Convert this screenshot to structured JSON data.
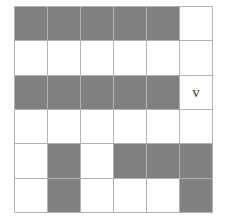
{
  "puzzle": {
    "title": "Shaded Grid Pattern",
    "rows": 6,
    "columns": 6,
    "fill_color": "#808080",
    "empty_color": "#ffffff",
    "gridline_color": "#b2b2b2",
    "label_color": "#3a3a3a",
    "cells": [
      [
        {
          "id": "r1c1",
          "state": "filled",
          "label": ""
        },
        {
          "id": "r1c2",
          "state": "filled",
          "label": ""
        },
        {
          "id": "r1c3",
          "state": "filled",
          "label": ""
        },
        {
          "id": "r1c4",
          "state": "filled",
          "label": ""
        },
        {
          "id": "r1c5",
          "state": "filled",
          "label": ""
        },
        {
          "id": "r1c6",
          "state": "empty",
          "label": ""
        }
      ],
      [
        {
          "id": "r2c1",
          "state": "empty",
          "label": ""
        },
        {
          "id": "r2c2",
          "state": "empty",
          "label": ""
        },
        {
          "id": "r2c3",
          "state": "empty",
          "label": ""
        },
        {
          "id": "r2c4",
          "state": "empty",
          "label": ""
        },
        {
          "id": "r2c5",
          "state": "empty",
          "label": ""
        },
        {
          "id": "r2c6",
          "state": "empty",
          "label": ""
        }
      ],
      [
        {
          "id": "r3c1",
          "state": "filled",
          "label": ""
        },
        {
          "id": "r3c2",
          "state": "filled",
          "label": ""
        },
        {
          "id": "r3c3",
          "state": "filled",
          "label": ""
        },
        {
          "id": "r3c4",
          "state": "filled",
          "label": ""
        },
        {
          "id": "r3c5",
          "state": "filled",
          "label": ""
        },
        {
          "id": "r3c6",
          "state": "empty",
          "label": "v"
        }
      ],
      [
        {
          "id": "r4c1",
          "state": "empty",
          "label": ""
        },
        {
          "id": "r4c2",
          "state": "empty",
          "label": ""
        },
        {
          "id": "r4c3",
          "state": "empty",
          "label": ""
        },
        {
          "id": "r4c4",
          "state": "empty",
          "label": ""
        },
        {
          "id": "r4c5",
          "state": "empty",
          "label": ""
        },
        {
          "id": "r4c6",
          "state": "empty",
          "label": ""
        }
      ],
      [
        {
          "id": "r5c1",
          "state": "empty",
          "label": ""
        },
        {
          "id": "r5c2",
          "state": "filled",
          "label": ""
        },
        {
          "id": "r5c3",
          "state": "empty",
          "label": ""
        },
        {
          "id": "r5c4",
          "state": "filled",
          "label": ""
        },
        {
          "id": "r5c5",
          "state": "filled",
          "label": ""
        },
        {
          "id": "r5c6",
          "state": "filled",
          "label": ""
        }
      ],
      [
        {
          "id": "r6c1",
          "state": "empty",
          "label": ""
        },
        {
          "id": "r6c2",
          "state": "filled",
          "label": ""
        },
        {
          "id": "r6c3",
          "state": "empty",
          "label": ""
        },
        {
          "id": "r6c4",
          "state": "empty",
          "label": ""
        },
        {
          "id": "r6c5",
          "state": "empty",
          "label": ""
        },
        {
          "id": "r6c6",
          "state": "filled",
          "label": ""
        }
      ]
    ]
  }
}
